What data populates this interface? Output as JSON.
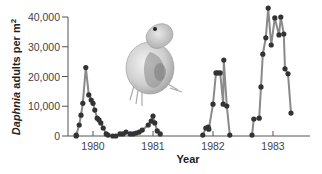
{
  "chart_data": {
    "type": "line",
    "title": "",
    "xlabel": "Year",
    "ylabel_italic": "Daphnia",
    "ylabel_rest": " adults per m",
    "ylabel_sup": "2",
    "ylim": [
      0,
      40000
    ],
    "y_ticks": [
      0,
      10000,
      20000,
      30000,
      40000
    ],
    "y_tick_labels": [
      "0",
      "10,000",
      "20,000",
      "30,000",
      "40,000"
    ],
    "x_ticks": [
      1980,
      1981,
      1982,
      1983
    ],
    "x_tick_labels": [
      "1980",
      "1981",
      "1982",
      "1983"
    ],
    "xlim": [
      1979.72,
      1983.62
    ],
    "grid": false,
    "line_color": "#8a8a8a",
    "marker_color": "#333333",
    "illustration": "daphnia",
    "series": [
      {
        "name": "Daphnia adults per m2 (1980-1981)",
        "points": [
          [
            1979.72,
            0
          ],
          [
            1979.72,
            300
          ],
          [
            1979.77,
            3700
          ],
          [
            1979.8,
            7000
          ],
          [
            1979.83,
            11000
          ],
          [
            1979.88,
            23000
          ],
          [
            1979.93,
            13800
          ],
          [
            1979.97,
            12100
          ],
          [
            1980.0,
            11000
          ],
          [
            1980.03,
            8700
          ],
          [
            1980.07,
            6000
          ],
          [
            1980.1,
            5400
          ],
          [
            1980.13,
            4400
          ],
          [
            1980.17,
            2700
          ],
          [
            1980.22,
            700
          ],
          [
            1980.25,
            300
          ],
          [
            1980.33,
            0
          ],
          [
            1980.38,
            0
          ],
          [
            1980.45,
            700
          ],
          [
            1980.5,
            700
          ],
          [
            1980.55,
            1300
          ],
          [
            1980.62,
            700
          ],
          [
            1980.67,
            700
          ],
          [
            1980.72,
            1000
          ],
          [
            1980.77,
            1300
          ],
          [
            1980.82,
            2000
          ],
          [
            1980.92,
            3700
          ],
          [
            1980.97,
            5000
          ],
          [
            1981.0,
            6700
          ],
          [
            1981.03,
            4400
          ],
          [
            1981.07,
            1700
          ],
          [
            1981.12,
            700
          ]
        ]
      },
      {
        "name": "Daphnia adults per m2 (1982)",
        "points": [
          [
            1981.83,
            300
          ],
          [
            1981.88,
            2700
          ],
          [
            1981.92,
            3000
          ],
          [
            1981.93,
            2300
          ],
          [
            1982.0,
            10700
          ],
          [
            1982.05,
            21200
          ],
          [
            1982.08,
            21200
          ],
          [
            1982.12,
            21200
          ],
          [
            1982.17,
            10700
          ],
          [
            1982.18,
            25500
          ],
          [
            1982.23,
            10100
          ],
          [
            1982.28,
            300
          ]
        ]
      },
      {
        "name": "Daphnia adults per m2 (1983)",
        "points": [
          [
            1982.65,
            300
          ],
          [
            1982.68,
            5700
          ],
          [
            1982.77,
            6000
          ],
          [
            1982.8,
            16500
          ],
          [
            1982.83,
            27500
          ],
          [
            1982.88,
            33000
          ],
          [
            1982.92,
            43000
          ],
          [
            1982.97,
            30600
          ],
          [
            1983.03,
            39700
          ],
          [
            1983.1,
            34000
          ],
          [
            1983.13,
            40000
          ],
          [
            1983.18,
            34300
          ],
          [
            1983.2,
            22600
          ],
          [
            1983.25,
            20900
          ],
          [
            1983.3,
            7700
          ]
        ]
      }
    ]
  },
  "axes": {
    "xlabel": "Year",
    "ylabel_italic": "Daphnia",
    "ylabel_rest": " adults per m",
    "ylabel_sup": "2"
  }
}
